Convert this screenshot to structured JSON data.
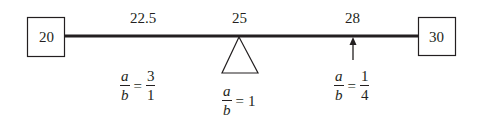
{
  "diagram": {
    "type": "balance-beam",
    "colors": {
      "stroke": "#231f20",
      "background": "#ffffff"
    },
    "left_box": {
      "value": "20"
    },
    "right_box": {
      "value": "30"
    },
    "top_labels": [
      {
        "value": "22.5"
      },
      {
        "value": "25"
      },
      {
        "value": "28"
      }
    ],
    "ratios": [
      {
        "num_var": "a",
        "den_var": "b",
        "equals": "=",
        "num": "3",
        "den": "1",
        "position": "under 22.5"
      },
      {
        "num_var": "a",
        "den_var": "b",
        "equals": "=",
        "value": "1",
        "position": "under fulcrum at 25"
      },
      {
        "num_var": "a",
        "den_var": "b",
        "equals": "=",
        "num": "1",
        "den": "4",
        "position": "under arrow at 28"
      }
    ],
    "fulcrum": {
      "shape": "triangle",
      "at": "25"
    },
    "pointer": {
      "shape": "up-arrow",
      "at": "28"
    }
  }
}
